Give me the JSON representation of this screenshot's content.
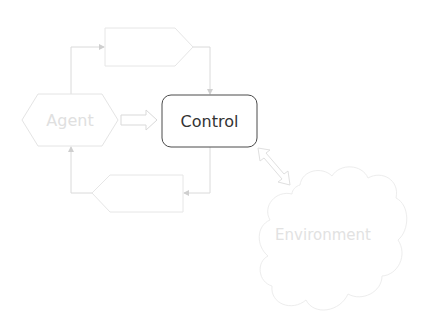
{
  "diagram": {
    "nodes": {
      "agent": {
        "label": "Agent",
        "shape": "hexagon",
        "color": "#e4e4e4",
        "text_color": "#e0e0e0"
      },
      "control": {
        "label": "Control",
        "shape": "rounded-rectangle",
        "color": "#555555",
        "text_color": "#333333"
      },
      "environment": {
        "label": "Environment",
        "shape": "cloud",
        "color": "#ececec",
        "text_color": "#e2e2e2"
      },
      "top_block": {
        "label": "",
        "shape": "pentagon-right",
        "color": "#e8e8e8"
      },
      "bottom_block": {
        "label": "",
        "shape": "pentagon-left",
        "color": "#e8e8e8"
      }
    },
    "edges": [
      {
        "from": "agent",
        "to": "top_block",
        "style": "line-arrow"
      },
      {
        "from": "top_block",
        "to": "control",
        "style": "line-arrow"
      },
      {
        "from": "control",
        "to": "bottom_block",
        "style": "line-arrow"
      },
      {
        "from": "bottom_block",
        "to": "agent",
        "style": "line-arrow"
      },
      {
        "from": "agent",
        "to": "control",
        "style": "hollow-block-arrow"
      },
      {
        "from": "control",
        "to": "environment",
        "style": "hollow-double-arrow"
      }
    ],
    "line_color": "#d6d6d6"
  }
}
